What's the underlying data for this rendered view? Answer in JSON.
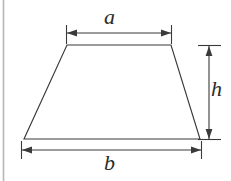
{
  "figure": {
    "kind": "geometry-diagram",
    "shape_name": "trapezoid",
    "background_color": "#ffffff",
    "stroke_color": "#3a3a3a",
    "label_color": "#2b2b2b",
    "edge_rule_color": "#b0b0b0",
    "labels": {
      "top_side": "a",
      "bottom_side": "b",
      "height": "h"
    },
    "dimensions": [
      {
        "name": "top-width-dimension",
        "label": "a",
        "orientation": "horizontal",
        "from": [
          66,
          33
        ],
        "to": [
          171,
          33
        ],
        "arrowheads": "both",
        "extension_ticks": true
      },
      {
        "name": "bottom-width-dimension",
        "label": "b",
        "orientation": "horizontal",
        "from": [
          21,
          150
        ],
        "to": [
          201,
          150
        ],
        "arrowheads": "both",
        "extension_ticks": true
      },
      {
        "name": "height-dimension",
        "label": "h",
        "orientation": "vertical",
        "from": [
          209,
          45
        ],
        "to": [
          209,
          139
        ],
        "arrowheads": "both",
        "extension_ticks": true
      }
    ],
    "shape_vertices": [
      [
        67,
        45
      ],
      [
        171,
        45
      ],
      [
        200,
        139
      ],
      [
        24,
        139
      ]
    ]
  }
}
